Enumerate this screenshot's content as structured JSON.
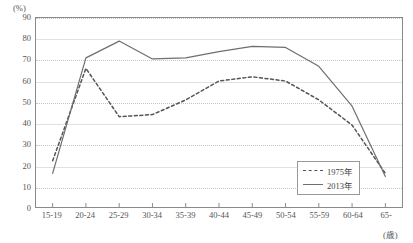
{
  "chart_data": {
    "type": "line",
    "title": "",
    "xlabel": "(歳)",
    "ylabel": "(%)",
    "categories": [
      "15-19",
      "20-24",
      "25-29",
      "30-34",
      "35-39",
      "40-44",
      "45-49",
      "50-54",
      "55-59",
      "60-64",
      "65-"
    ],
    "ylim": [
      0,
      90
    ],
    "ytick_labels": [
      "0",
      "10",
      "20",
      "30",
      "40",
      "50",
      "60",
      "70",
      "80",
      "90"
    ],
    "ytick_values": [
      0,
      10,
      20,
      30,
      40,
      50,
      60,
      70,
      80,
      90
    ],
    "grid": true,
    "legend_position": "bottom-right",
    "series": [
      {
        "name": "1975年",
        "style": "dashed",
        "color": "#555555",
        "values": [
          22,
          66,
          43,
          44,
          51,
          60,
          62,
          60,
          51,
          39,
          16
        ]
      },
      {
        "name": "2013年",
        "style": "solid",
        "color": "#6e6e6e",
        "values": [
          16,
          71,
          79,
          70.5,
          71,
          74,
          76.5,
          76,
          67,
          48,
          14.5
        ]
      }
    ]
  },
  "axes": {
    "y_unit": "(%)",
    "x_unit": "(歳)"
  },
  "legend": {
    "items": [
      {
        "label": "1975年"
      },
      {
        "label": "2013年"
      }
    ]
  }
}
